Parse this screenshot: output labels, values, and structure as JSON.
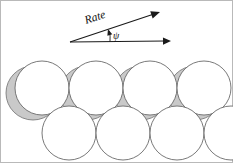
{
  "figure": {
    "name": "rate-vector-and-circle-packing-diagram",
    "width": 233,
    "height": 163,
    "background_color": "#ffffff",
    "border_color": "#b9b9b9"
  },
  "vectors": {
    "origin": {
      "x": 70,
      "y": 42
    },
    "rate_vector": {
      "label": "Rate",
      "label_rotation_deg": -18,
      "label_x": 86,
      "label_y": 24,
      "tip": {
        "x": 160,
        "y": 12
      },
      "color": "#1a1a1a"
    },
    "reference_vector": {
      "label": "",
      "tip": {
        "x": 171,
        "y": 41
      },
      "color": "#1a1a1a"
    },
    "angle": {
      "label": "ψ",
      "label_x": 113,
      "label_y": 39,
      "arc_radius": 40,
      "color": "#1a1a1a"
    }
  },
  "packing": {
    "circle_radius": 27,
    "shadow_offset": {
      "x": -9,
      "y": 5
    },
    "shadow_color": "#c9c9c9",
    "shadow_stroke": "#6e6e6e",
    "circle_fill": "#ffffff",
    "circle_stroke": "#6a6a6a",
    "top_row": [
      {
        "cx": 42,
        "cy": 88
      },
      {
        "cx": 96,
        "cy": 88
      },
      {
        "cx": 150,
        "cy": 88
      },
      {
        "cx": 204,
        "cy": 88
      }
    ],
    "bottom_row": [
      {
        "cx": 69,
        "cy": 133
      },
      {
        "cx": 123,
        "cy": 133
      },
      {
        "cx": 177,
        "cy": 133
      },
      {
        "cx": 231,
        "cy": 133
      }
    ]
  }
}
